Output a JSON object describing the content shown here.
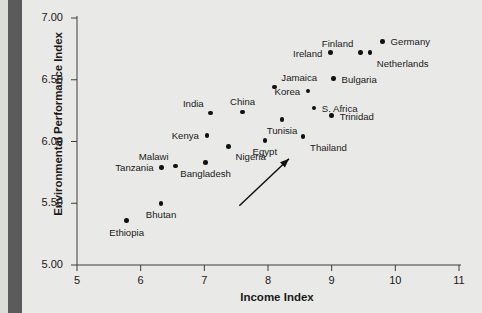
{
  "chart_data": {
    "type": "scatter",
    "title": "",
    "xlabel": "Income Index",
    "ylabel": "Environmental Performance Index",
    "xlim": [
      5,
      11
    ],
    "ylim": [
      5.0,
      7.0
    ],
    "xticks": [
      "5",
      "6",
      "7",
      "8",
      "9",
      "10",
      "11"
    ],
    "yticks": [
      "5.00",
      "5.50",
      "6.00",
      "6.50",
      "7.00"
    ],
    "grid": false,
    "legend": null,
    "marker_color": "#111111",
    "background_color": "#e9e9e7",
    "points": [
      {
        "label": "Ethiopia",
        "x": 5.78,
        "y": 5.36,
        "label_pos": "below"
      },
      {
        "label": "Bhutan",
        "x": 6.32,
        "y": 5.5,
        "label_pos": "below"
      },
      {
        "label": "Tanzania",
        "x": 6.33,
        "y": 5.79,
        "label_pos": "left"
      },
      {
        "label": "Malawi",
        "x": 6.55,
        "y": 5.8,
        "label_pos": "above-left"
      },
      {
        "label": "Bangladesh",
        "x": 7.02,
        "y": 5.83,
        "label_pos": "below"
      },
      {
        "label": "Kenya",
        "x": 7.04,
        "y": 6.05,
        "label_pos": "left"
      },
      {
        "label": "India",
        "x": 7.1,
        "y": 6.23,
        "label_pos": "above-left"
      },
      {
        "label": "Nigeria",
        "x": 7.38,
        "y": 5.96,
        "label_pos": "below-right"
      },
      {
        "label": "China",
        "x": 7.6,
        "y": 6.24,
        "label_pos": "above"
      },
      {
        "label": "Egypt",
        "x": 7.95,
        "y": 6.01,
        "label_pos": "below"
      },
      {
        "label": "Jamaica",
        "x": 8.1,
        "y": 6.44,
        "label_pos": "above-right"
      },
      {
        "label": "Tunisia",
        "x": 8.22,
        "y": 6.18,
        "label_pos": "below"
      },
      {
        "label": "Thailand",
        "x": 8.55,
        "y": 6.04,
        "label_pos": "below-right"
      },
      {
        "label": "Korea",
        "x": 8.63,
        "y": 6.41,
        "label_pos": "left"
      },
      {
        "label": "S. Africa",
        "x": 8.72,
        "y": 6.27,
        "label_pos": "right"
      },
      {
        "label": "Trinidad",
        "x": 9.0,
        "y": 6.21,
        "label_pos": "right"
      },
      {
        "label": "Ireland",
        "x": 8.98,
        "y": 6.72,
        "label_pos": "left"
      },
      {
        "label": "Bulgaria",
        "x": 9.03,
        "y": 6.51,
        "label_pos": "right"
      },
      {
        "label": "Finland",
        "x": 9.45,
        "y": 6.72,
        "label_pos": "above-left"
      },
      {
        "label": "Germany",
        "x": 9.8,
        "y": 6.81,
        "label_pos": "right"
      },
      {
        "label": "Netherlands",
        "x": 9.6,
        "y": 6.72,
        "label_pos": "below-right"
      }
    ],
    "annotations": [
      {
        "type": "arrow",
        "name": "trend-arrow",
        "x_start": 7.55,
        "y_start": 5.48,
        "x_end": 8.33,
        "y_end": 5.86
      }
    ]
  }
}
